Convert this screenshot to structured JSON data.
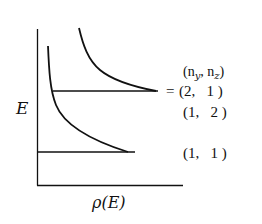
{
  "diagram": {
    "type": "energy-level density-of-states sketch",
    "y_axis_label": "E",
    "x_axis_label": "ρ(E)",
    "header_label": "(n_y, n_z)",
    "levels": [
      {
        "name": "upper",
        "labels": [
          "(2,  1 )",
          "(1,  2 )"
        ],
        "degenerate": true,
        "prefix": "="
      },
      {
        "name": "lower",
        "labels": [
          "(1,  1 )"
        ],
        "degenerate": false
      }
    ],
    "labels": {
      "header": "(n",
      "header_sub_y": "y",
      "header_mid": ", n",
      "header_sub_z": "z",
      "header_close": ")",
      "equals": "=",
      "level_2_1": "(2,   1 )",
      "level_1_2": "(1,   2 )",
      "level_1_1": "(1,   1 )",
      "e_axis": "E",
      "rho_axis_rho": "ρ",
      "rho_axis_arg": "(E)"
    },
    "colors": {
      "stroke": "#111111",
      "background": "#ffffff"
    }
  }
}
